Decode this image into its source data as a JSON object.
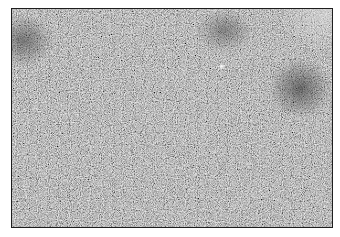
{
  "image": {
    "description": "Grayscale fine-grained texture photograph with thin dark border",
    "base_gray": "#8f8f8f",
    "border_color": "#1e1e1e",
    "features": [
      {
        "name": "dark-patch-top-left",
        "cx": 20,
        "cy": 40,
        "r": 28,
        "color": "#555555"
      },
      {
        "name": "dark-patch-top-center-right",
        "cx": 225,
        "cy": 28,
        "r": 26,
        "color": "#5e5e5e"
      },
      {
        "name": "dark-patch-right",
        "cx": 295,
        "cy": 85,
        "r": 30,
        "color": "#4f4f4f"
      },
      {
        "name": "light-region-top-right-corner",
        "cx": 320,
        "cy": 10,
        "r": 45,
        "color": "#c8c8c8"
      },
      {
        "name": "bright-speck",
        "cx": 222,
        "cy": 66,
        "r": 4,
        "color": "#f0f0f0"
      }
    ]
  }
}
